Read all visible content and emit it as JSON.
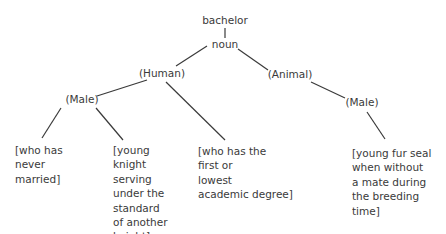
{
  "tree": {
    "root": "bachelor",
    "pos": "noun",
    "human": "(Human)",
    "animal": "(Animal)",
    "male_human": "(Male)",
    "male_animal": "(Male)"
  },
  "leaves": [
    "[who has\nnever\nmarried]",
    "[young\nknight\nserving\nunder the\nstandard\nof another\nknight]",
    "[who has the\nfirst or\nlowest\nacademic degree]",
    "[young fur seal\nwhen without\na mate during\nthe breeding\ntime]"
  ]
}
